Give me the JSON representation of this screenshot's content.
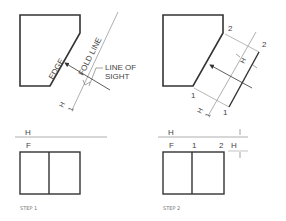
{
  "figure": {
    "colors": {
      "object_line": "#333333",
      "thin_line": "#9a9a9a",
      "text": "#444444",
      "caption": "#777777",
      "background": "#ffffff"
    },
    "step1": {
      "labels": {
        "edge": "EDGE",
        "fold_line": "FOLD LINE",
        "line_of_sight_1": "LINE OF",
        "line_of_sight_2": "SIGHT",
        "fold_h": "H",
        "fold_1": "1"
      },
      "front_view": {
        "fold_top": "H",
        "fold_bottom": "F"
      },
      "caption": "STEP 1"
    },
    "step2": {
      "labels": {
        "point_2_top": "2",
        "point_2_right": "2",
        "point_1_left": "1",
        "point_1_bottom": "1",
        "dim_h": "H",
        "fold_h": "H",
        "fold_1": "1"
      },
      "front_view": {
        "fold_top": "H",
        "fold_bottom": "F",
        "point_1": "1",
        "point_2": "2",
        "dim_h": "H"
      },
      "caption": "STEP 2"
    }
  }
}
